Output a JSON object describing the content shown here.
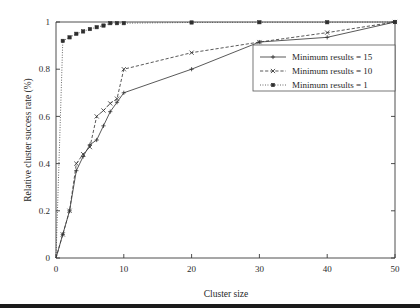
{
  "chart_data": {
    "type": "line",
    "title": "",
    "xlabel": "Cluster size",
    "ylabel": "Relative cluster success rate (%)",
    "xlim": [
      0,
      50
    ],
    "ylim": [
      0,
      1
    ],
    "xticks": [
      0,
      10,
      20,
      30,
      40,
      50
    ],
    "xticklabels": [
      "0",
      "10",
      "20",
      "30",
      "40",
      "50"
    ],
    "yticks": [
      0,
      0.2,
      0.4,
      0.6,
      0.8,
      1
    ],
    "yticklabels": [
      "0",
      "0.2",
      "0.4",
      "0.6",
      "0.8",
      "1"
    ],
    "grid": false,
    "legend_position": "center right",
    "series": [
      {
        "name": "Minimum results = 15",
        "linestyle": "solid",
        "marker": "plus",
        "x": [
          0,
          1,
          2,
          3,
          4,
          5,
          6,
          7,
          8,
          9,
          10,
          20,
          30,
          40,
          50
        ],
        "y": [
          0,
          0.1,
          0.2,
          0.37,
          0.43,
          0.48,
          0.5,
          0.56,
          0.62,
          0.66,
          0.7,
          0.8,
          0.915,
          0.935,
          1.0
        ]
      },
      {
        "name": "Minimum results = 10",
        "linestyle": "dashed",
        "marker": "cross",
        "x": [
          0,
          1,
          2,
          3,
          4,
          5,
          6,
          7,
          8,
          9,
          10,
          20,
          30,
          40,
          50
        ],
        "y": [
          0,
          0.1,
          0.2,
          0.4,
          0.44,
          0.47,
          0.6,
          0.625,
          0.655,
          0.675,
          0.8,
          0.87,
          0.915,
          0.955,
          1.0
        ]
      },
      {
        "name": "Minimum results = 1",
        "linestyle": "dotted",
        "marker": "square",
        "x": [
          0,
          1,
          2,
          3,
          4,
          5,
          6,
          7,
          8,
          9,
          10,
          20,
          30,
          40,
          50
        ],
        "y": [
          0,
          0.92,
          0.935,
          0.95,
          0.96,
          0.97,
          0.978,
          0.985,
          0.995,
          0.995,
          0.995,
          0.998,
          0.999,
          0.999,
          1.0
        ]
      }
    ]
  },
  "legend": {
    "entries": [
      {
        "label": "Minimum results = 15"
      },
      {
        "label": "Minimum results = 10"
      },
      {
        "label": "Minimum results = 1"
      }
    ]
  },
  "axes": {
    "x_title": "Cluster size",
    "y_title": "Relative cluster success rate (%)",
    "x_tick_labels": [
      "0",
      "10",
      "20",
      "30",
      "40",
      "50"
    ],
    "y_tick_labels": [
      "0",
      "0.2",
      "0.4",
      "0.6",
      "0.8",
      "1"
    ]
  }
}
